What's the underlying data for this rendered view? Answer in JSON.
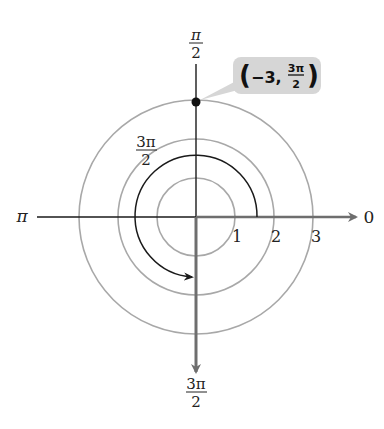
{
  "diagram": {
    "type": "polar-coordinate-plot",
    "center": {
      "x": 196,
      "y": 217
    },
    "unit_px": 39,
    "axis_labels": {
      "right": "0",
      "top": {
        "numerator": "π",
        "denominator": "2"
      },
      "left": "π",
      "bottom": {
        "numerator": "3π",
        "denominator": "2"
      }
    },
    "radial_ticks": [
      "1",
      "2",
      "3"
    ],
    "arc_angle_label": {
      "numerator": "3π",
      "denominator": "2"
    },
    "point": {
      "r": -3,
      "theta": "3π/2",
      "label": {
        "open": "(",
        "r": "−3,",
        "theta_numerator": "3π",
        "theta_denominator": "2",
        "close": ")"
      }
    },
    "colors": {
      "grid_circle": "#a8a8a8",
      "axis_thin": "#1a1a1a",
      "axis_thick": "#6e6e6e",
      "arc": "#1a1a1a",
      "callout_bg": "#d6d6d6",
      "point": "#111111"
    }
  }
}
